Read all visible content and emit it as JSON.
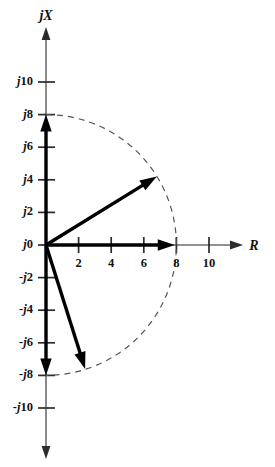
{
  "figure": {
    "background_color": "#ffffff",
    "axis_color": "#6d6d6d",
    "tick_color": "#2b2b2b",
    "phasor_color": "#000000",
    "arc_color": "#555555"
  },
  "axes": {
    "vertical": {
      "name": "jX",
      "name_prefix": "j",
      "name_symbol": "X",
      "tick_labels": [
        "j10",
        "j8",
        "j6",
        "j4",
        "j2",
        "j0",
        "-j2",
        "-j4",
        "-j6",
        "-j8",
        "-j10"
      ],
      "tick_values": [
        10,
        8,
        6,
        4,
        2,
        0,
        -2,
        -4,
        -6,
        -8,
        -10
      ]
    },
    "horizontal": {
      "name": "R",
      "tick_labels": [
        "2",
        "4",
        "6",
        "8",
        "10"
      ],
      "tick_values": [
        2,
        4,
        6,
        8,
        10
      ]
    }
  },
  "chart_data": {
    "type": "scatter",
    "title": "",
    "xlabel": "R",
    "ylabel": "jX",
    "xlim": [
      -1,
      12.5
    ],
    "ylim": [
      -12.5,
      12.5
    ],
    "grid": false,
    "legend": "none",
    "origin": {
      "x": 0,
      "y": 0,
      "label": "j0"
    },
    "x_ticks": [
      2,
      4,
      6,
      8,
      10
    ],
    "x_tick_labels": [
      "2",
      "4",
      "6",
      "8",
      "10"
    ],
    "y_ticks": [
      10,
      8,
      6,
      4,
      2,
      0,
      -2,
      -4,
      -6,
      -8,
      -10
    ],
    "y_tick_labels": [
      "j10",
      "j8",
      "j6",
      "j4",
      "j2",
      "j0",
      "-j2",
      "-j4",
      "-j6",
      "-j8",
      "-j10"
    ],
    "annotations": [
      {
        "kind": "arc",
        "name": "constant-magnitude-arc",
        "radius": 8,
        "start_angle_deg": 90,
        "end_angle_deg": -90,
        "style": "dashed",
        "description": "dashed semicircle of radius 8 through the right half plane"
      }
    ],
    "series": [
      {
        "name": "phasor-pure-inductive",
        "type": "vector",
        "from": [
          0,
          0
        ],
        "to": [
          0,
          8
        ],
        "magnitude": 8,
        "angle_deg": 90,
        "label": "j8"
      },
      {
        "name": "phasor-inductive",
        "type": "vector",
        "from": [
          0,
          0
        ],
        "to": [
          6.8,
          4.2
        ],
        "magnitude": 8,
        "angle_deg": 31.7,
        "label": ""
      },
      {
        "name": "phasor-pure-resistive",
        "type": "vector",
        "from": [
          0,
          0
        ],
        "to": [
          7.9,
          0
        ],
        "magnitude": 8,
        "angle_deg": 0,
        "label": "8"
      },
      {
        "name": "phasor-capacitive",
        "type": "vector",
        "from": [
          0,
          0
        ],
        "to": [
          2.4,
          -7.6
        ],
        "magnitude": 8,
        "angle_deg": -72.5,
        "label": ""
      },
      {
        "name": "phasor-pure-capacitive",
        "type": "vector",
        "from": [
          0,
          0
        ],
        "to": [
          0,
          -8
        ],
        "magnitude": 8,
        "angle_deg": -90,
        "label": "-j8"
      }
    ]
  }
}
